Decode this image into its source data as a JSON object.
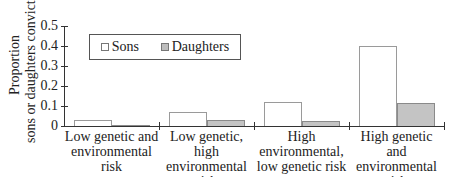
{
  "chart_data": {
    "type": "bar",
    "title": "",
    "xlabel": "",
    "ylabel": "Proportion sons or daughters convicted",
    "ylabel_lines": [
      "Proportion",
      "sons or daughters convicted"
    ],
    "ylim": [
      0,
      0.5
    ],
    "yticks": [
      "0",
      "0.1",
      "0.2",
      "0.3",
      "0.4",
      "0.5"
    ],
    "grid": false,
    "legend_position": "upper-left inside",
    "categories": [
      "Low genetic and environmental risk",
      "Low genetic, high environmental risk",
      "High environmental, low genetic risk",
      "High genetic and environmental risk"
    ],
    "category_label_lines": [
      [
        "Low genetic and",
        "environmental risk"
      ],
      [
        "Low genetic,",
        "high",
        "environmental risk"
      ],
      [
        "High",
        "environmental,",
        "low genetic risk"
      ],
      [
        "High genetic and",
        "environmental risk"
      ]
    ],
    "series": [
      {
        "name": "Sons",
        "color": "#ffffff",
        "values": [
          0.03,
          0.068,
          0.12,
          0.4
        ]
      },
      {
        "name": "Daughters",
        "color": "#c4c4c4",
        "values": [
          0.005,
          0.03,
          0.025,
          0.115
        ]
      }
    ]
  },
  "legend": {
    "sons": "Sons",
    "daughters": "Daughters"
  }
}
